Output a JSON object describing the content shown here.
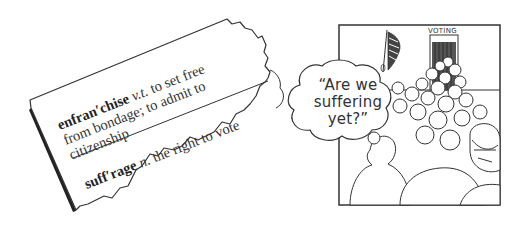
{
  "dictionary_clipping": {
    "entries": [
      {
        "headword": "enfran′chise",
        "part_of_speech": "v.t.",
        "definition_line1": "to set free",
        "definition_line2": "from bondage; to admit to",
        "definition_line3": "citizenship"
      },
      {
        "headword": "suff′rage",
        "part_of_speech": "n.",
        "definition_line1": "the right to vote"
      }
    ]
  },
  "cartoon_panel": {
    "speech_bubble": {
      "line1": "“Are we",
      "line2": "suffering",
      "line3": "yet?”"
    },
    "sign": "VOTING"
  },
  "colors": {
    "ink": "#333333",
    "paper": "#ffffff",
    "shadow": "#222222"
  }
}
